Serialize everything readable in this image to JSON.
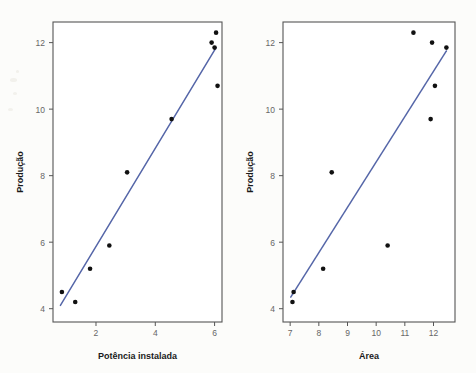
{
  "figure": {
    "background_color": "#fcfcfa",
    "frame_color": "#555555",
    "point_color": "#111111",
    "line_color": "#5566a8",
    "tick_label_color": "#666666",
    "axis_title_color": "#1a1a1a"
  },
  "chart_data": [
    {
      "type": "scatter",
      "title": "",
      "xlabel": "Potência instalada",
      "ylabel": "Produção",
      "xlim": [
        0.55,
        6.25
      ],
      "ylim": [
        3.6,
        12.62
      ],
      "xticks": [
        2,
        4,
        6
      ],
      "yticks": [
        4,
        6,
        8,
        10,
        12
      ],
      "xticklabels": [
        "2",
        "4",
        "6"
      ],
      "yticklabels": [
        "4",
        "6",
        "8",
        "10",
        "12"
      ],
      "grid": false,
      "legend": null,
      "x": [
        0.85,
        1.3,
        1.8,
        2.45,
        3.05,
        4.55,
        5.9,
        6.0,
        6.05,
        6.1
      ],
      "y": [
        4.5,
        4.2,
        5.2,
        5.9,
        8.1,
        9.7,
        12.0,
        11.85,
        12.3,
        10.7
      ],
      "fit_line": {
        "type": "line",
        "x": [
          0.8,
          6.05
        ],
        "y": [
          4.1,
          11.85
        ],
        "color": "#5566a8"
      }
    },
    {
      "type": "scatter",
      "title": "",
      "xlabel": "Área",
      "ylabel": "Produção",
      "xlim": [
        6.75,
        12.75
      ],
      "ylim": [
        3.6,
        12.62
      ],
      "xticks": [
        7,
        8,
        9,
        10,
        11,
        12
      ],
      "yticks": [
        4,
        6,
        8,
        10,
        12
      ],
      "xticklabels": [
        "7",
        "8",
        "9",
        "10",
        "11",
        "12"
      ],
      "yticklabels": [
        "4",
        "6",
        "8",
        "10",
        "12"
      ],
      "grid": false,
      "legend": null,
      "x": [
        7.08,
        7.12,
        8.15,
        8.45,
        10.4,
        11.3,
        11.9,
        11.95,
        12.05,
        12.45
      ],
      "y": [
        4.2,
        4.5,
        5.2,
        8.1,
        5.9,
        12.3,
        9.7,
        12.0,
        10.7,
        11.85
      ],
      "fit_line": {
        "type": "line",
        "x": [
          7.02,
          12.45
        ],
        "y": [
          4.35,
          11.75
        ],
        "color": "#5566a8"
      }
    }
  ]
}
